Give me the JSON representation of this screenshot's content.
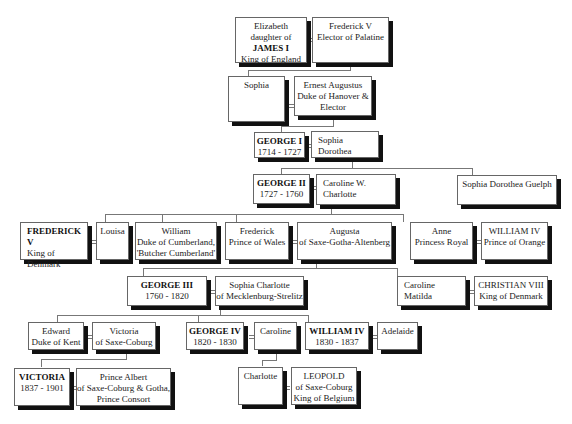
{
  "people": {
    "elizabeth": {
      "lines": [
        "Elizabeth",
        "daughter of",
        "JAMES I",
        "King of England"
      ],
      "bold_line": 2
    },
    "frederick_v_palatine": {
      "lines": [
        "Frederick V",
        "Elector of Palatine"
      ]
    },
    "sophia": {
      "lines": [
        "Sophia"
      ]
    },
    "ernest_augustus": {
      "lines": [
        "Ernest Augustus",
        "Duke of Hanover &",
        "Elector"
      ]
    },
    "george_i": {
      "lines": [
        "GEORGE I",
        "1714 - 1727"
      ],
      "bold_line": 0
    },
    "sophia_dorothea": {
      "lines": [
        "Sophia Dorothea"
      ]
    },
    "george_ii": {
      "lines": [
        "GEORGE II",
        "1727 - 1760"
      ],
      "bold_line": 0
    },
    "caroline_w_charlotte": {
      "lines": [
        "Caroline W. Charlotte"
      ]
    },
    "sophia_dorothea_guelph": {
      "lines": [
        "Sophia Dorothea Guelph"
      ]
    },
    "frederick_v_denmark": {
      "lines": [
        "FREDERICK V",
        "King of Denmark"
      ],
      "bold_line": 0
    },
    "louisa": {
      "lines": [
        "Louisa"
      ]
    },
    "william_cumberland": {
      "lines": [
        "William",
        "Duke of Cumberland,",
        "'Butcher Cumberland'"
      ]
    },
    "frederick_wales": {
      "lines": [
        "Frederick",
        "Prince of Wales"
      ]
    },
    "augusta": {
      "lines": [
        "Augusta",
        "of Saxe-Gotha-Altenberg"
      ]
    },
    "anne": {
      "lines": [
        "Anne",
        "Princess Royal"
      ]
    },
    "william_iv_orange": {
      "lines": [
        "WILLIAM IV",
        "Prince of Orange"
      ]
    },
    "george_iii": {
      "lines": [
        "GEORGE III",
        "1760 - 1820"
      ],
      "bold_line": 0
    },
    "sophia_charlotte": {
      "lines": [
        "Sophia Charlotte",
        "of Mecklenburg-Strelitz"
      ]
    },
    "caroline_matilda": {
      "lines": [
        "Caroline Matilda"
      ]
    },
    "christian_viii": {
      "lines": [
        "CHRISTIAN VIII",
        "King of Denmark"
      ]
    },
    "edward": {
      "lines": [
        "Edward",
        "Duke of Kent"
      ]
    },
    "victoria_saxe": {
      "lines": [
        "Victoria",
        "of Saxe-Coburg"
      ]
    },
    "george_iv": {
      "lines": [
        "GEORGE IV",
        "1820 - 1830"
      ],
      "bold_line": 0
    },
    "caroline": {
      "lines": [
        "Caroline"
      ]
    },
    "william_iv": {
      "lines": [
        "WILLIAM IV",
        "1830 - 1837"
      ],
      "bold_line": 0
    },
    "adelaide": {
      "lines": [
        "Adelaide"
      ]
    },
    "victoria": {
      "lines": [
        "VICTORIA",
        "1837 - 1901"
      ],
      "bold_line": 0
    },
    "albert": {
      "lines": [
        "Prince Albert",
        "of Saxe-Coburg & Gotha,",
        "Prince Consort"
      ]
    },
    "charlotte": {
      "lines": [
        "Charlotte"
      ]
    },
    "leopold": {
      "lines": [
        "LEOPOLD",
        "of Saxe-Coburg",
        "King of Belgium"
      ]
    }
  }
}
